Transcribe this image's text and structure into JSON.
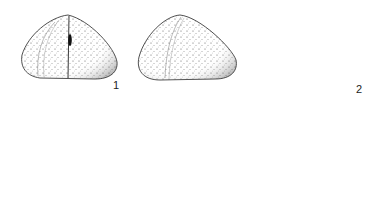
{
  "plate": {
    "description": "Scientific line illustration plate of echinoid (sea urchin) tests",
    "figures": [
      {
        "number": "1",
        "views": [
          "lateral-view",
          "lateral-view-oblique",
          "oral-view",
          "aboral-view"
        ]
      },
      {
        "number": "2",
        "views": [
          "lateral-view",
          "aboral-view"
        ]
      }
    ],
    "labels": {
      "fig1": "1",
      "fig2": "2"
    },
    "colors": {
      "ink": "#1a1a1a",
      "paper": "#ffffff",
      "stipple": "#555555"
    }
  }
}
